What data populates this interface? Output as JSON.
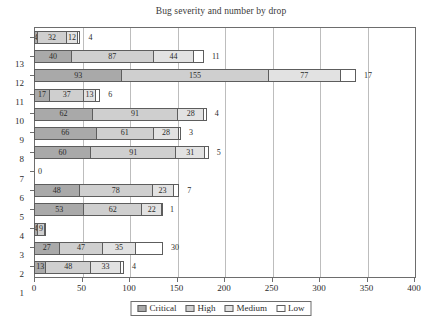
{
  "chart_data": {
    "type": "bar",
    "orientation": "horizontal",
    "stacked": true,
    "title": "Bug severity and number by drop",
    "xlabel": "",
    "ylabel": "",
    "xlim": [
      0,
      400
    ],
    "xticks": [
      0,
      50,
      100,
      150,
      200,
      250,
      300,
      350,
      400
    ],
    "grid": true,
    "legend_position": "bottom",
    "categories": [
      "13",
      "12",
      "11",
      "10",
      "9",
      "8",
      "7",
      "6",
      "5",
      "4",
      "3",
      "2",
      "1"
    ],
    "series": [
      {
        "name": "Critical",
        "color": "#a9a9a9",
        "values": [
          4,
          40,
          93,
          17,
          62,
          66,
          60,
          0,
          48,
          53,
          4,
          27,
          13
        ]
      },
      {
        "name": "High",
        "color": "#cfcfcf",
        "values": [
          32,
          87,
          155,
          37,
          91,
          61,
          91,
          0,
          78,
          62,
          9,
          47,
          48
        ]
      },
      {
        "name": "Medium",
        "color": "#e2e2e2",
        "values": [
          12,
          44,
          77,
          13,
          28,
          28,
          31,
          0,
          23,
          22,
          1,
          35,
          33
        ]
      },
      {
        "name": "Low",
        "color": "#ffffff",
        "values": [
          4,
          11,
          17,
          6,
          4,
          3,
          5,
          0,
          7,
          1,
          0,
          30,
          4
        ]
      }
    ],
    "zero_row_label": "0",
    "zero_row_category": "6"
  },
  "legend": {
    "items": [
      {
        "label": "Critical",
        "swatch": "c0"
      },
      {
        "label": "High",
        "swatch": "c1"
      },
      {
        "label": "Medium",
        "swatch": "c2"
      },
      {
        "label": "Low",
        "swatch": "c3"
      }
    ]
  }
}
